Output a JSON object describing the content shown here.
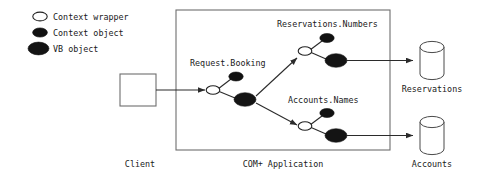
{
  "figure": {
    "background": "#ffffff",
    "ink": "#1a1a1a"
  },
  "legend": {
    "items": [
      {
        "marker": "context-wrapper-ellipse",
        "label": "Context wrapper",
        "fill": "#ffffff",
        "stroke": "#222222"
      },
      {
        "marker": "context-object-ellipse",
        "label": "Context object",
        "fill": "#111111",
        "stroke": "#111111"
      },
      {
        "marker": "vb-object-ellipse",
        "label": "VB object",
        "fill": "#141414",
        "stroke": "#141414"
      }
    ]
  },
  "client": {
    "label": "Client",
    "box_name": "client-box"
  },
  "container": {
    "label": "COM+ Application",
    "border_color": "#6e6e6e"
  },
  "nodes": [
    {
      "id": "request-booking",
      "label": "Request.Booking"
    },
    {
      "id": "reservations-numbers",
      "label": "Reservations.Numbers"
    },
    {
      "id": "accounts-names",
      "label": "Accounts.Names"
    }
  ],
  "databases": [
    {
      "id": "reservations-db",
      "label": "Reservations"
    },
    {
      "id": "accounts-db",
      "label": "Accounts"
    }
  ]
}
